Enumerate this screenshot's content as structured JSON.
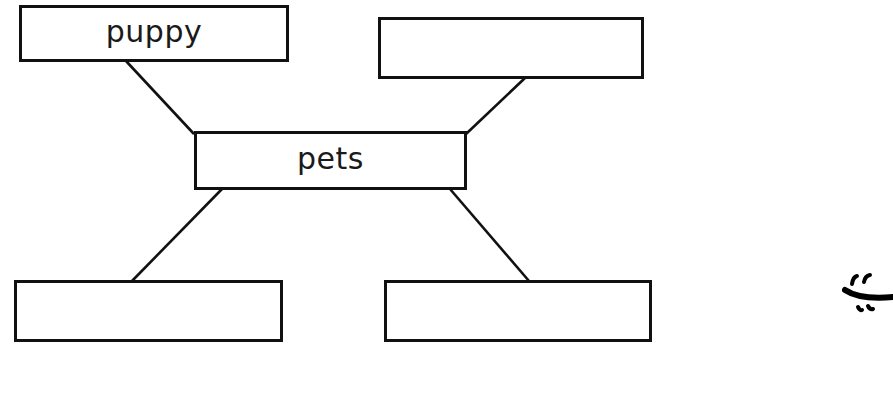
{
  "diagram": {
    "type": "concept-web",
    "center": {
      "id": "pets",
      "label": "pets"
    },
    "nodes": [
      {
        "id": "puppy",
        "label": "puppy",
        "position": "top-left"
      },
      {
        "id": "top-right",
        "label": "",
        "position": "top-right"
      },
      {
        "id": "bottom-left",
        "label": "",
        "position": "bottom-left"
      },
      {
        "id": "bottom-right",
        "label": "",
        "position": "bottom-right"
      }
    ],
    "edges": [
      {
        "from": "pets",
        "to": "puppy"
      },
      {
        "from": "pets",
        "to": "top-right"
      },
      {
        "from": "pets",
        "to": "bottom-left"
      },
      {
        "from": "pets",
        "to": "bottom-right"
      }
    ],
    "decoration": {
      "icon": "partial-smiley-face-icon",
      "position": "right-edge"
    },
    "colors": {
      "stroke": "#111111",
      "background": "#ffffff",
      "text": "#1a1a1a"
    }
  }
}
